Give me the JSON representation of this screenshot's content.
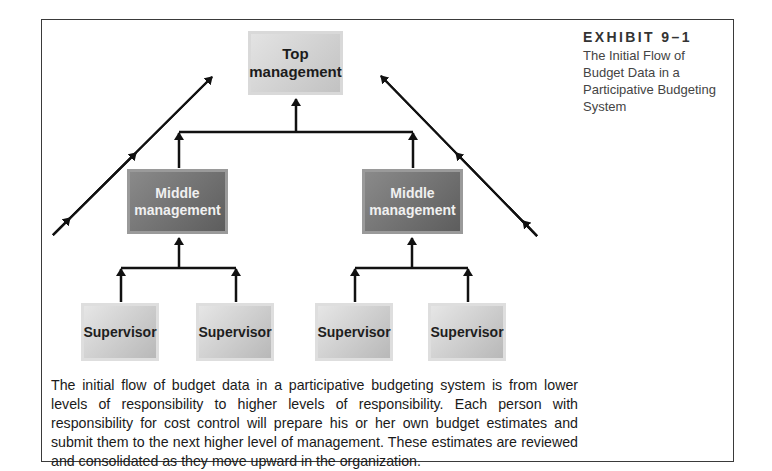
{
  "exhibit": {
    "label": "EXHIBIT 9–1",
    "title": "The Initial Flow of Budget Data in a Participative Budgeting System"
  },
  "diagram": {
    "top": {
      "label": "Top management"
    },
    "middle": [
      {
        "label": "Middle management"
      },
      {
        "label": "Middle management"
      }
    ],
    "supervisors": [
      {
        "label": "Supervisor",
        "reports_to": 0
      },
      {
        "label": "Supervisor",
        "reports_to": 0
      },
      {
        "label": "Supervisor",
        "reports_to": 1
      },
      {
        "label": "Supervisor",
        "reports_to": 1
      }
    ],
    "flow_direction": "upward"
  },
  "caption": "The initial flow of budget data in a participative budgeting system is from lower levels of responsibility to higher levels of responsibility. Each person with responsibility for cost control will prepare his or her own budget estimates and submit them to the next higher level of management. These estimates are reviewed and consolidated as they move upward in the organization.",
  "colors": {
    "line": "#111111",
    "frame": "#3a3a3a",
    "top_box": "#cfcfcf",
    "middle_box": "#707070",
    "supervisor_box": "#cccccc"
  }
}
